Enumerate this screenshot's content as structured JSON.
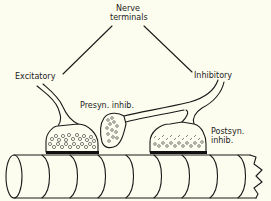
{
  "diagram": {
    "type": "neuroanatomy-synapse-schematic",
    "background": "#fdfdef",
    "ink": "#1a1a1a",
    "labels": {
      "nerve_terminals_line1": "Nerve",
      "nerve_terminals_line2": "terminals",
      "excitatory": "Excitatory",
      "inhibitory": "Inhibitory",
      "presyn_inhib": "Presyn. inhib.",
      "postsyn_inhib_line1": "Postsyn.",
      "postsyn_inhib_line2": "inhib."
    },
    "nodes": [
      {
        "id": "nerve-terminals",
        "label": "Nerve terminals"
      },
      {
        "id": "excitatory",
        "label": "Excitatory"
      },
      {
        "id": "inhibitory",
        "label": "Inhibitory"
      },
      {
        "id": "presynaptic-inhibitory-terminal",
        "label": "Presyn. inhib."
      },
      {
        "id": "postsynaptic-inhibitory-terminal",
        "label": "Postsyn. inhib."
      },
      {
        "id": "postsynaptic-axon-cylinder",
        "label": ""
      }
    ],
    "edges": [
      {
        "from": "nerve-terminals",
        "to": "excitatory"
      },
      {
        "from": "nerve-terminals",
        "to": "inhibitory"
      },
      {
        "from": "inhibitory",
        "to": "presynaptic-inhibitory-terminal"
      },
      {
        "from": "inhibitory",
        "to": "postsynaptic-inhibitory-terminal"
      },
      {
        "from": "presynaptic-inhibitory-terminal",
        "to": "excitatory"
      }
    ]
  }
}
